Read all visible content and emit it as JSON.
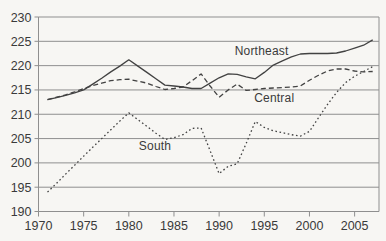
{
  "figure": {
    "background_color": "#f7f6f3",
    "text_color": "#3a3a3a",
    "grid_color": "#8f8f8f",
    "line_color": "#424242"
  },
  "chart_data": {
    "type": "line",
    "title": "",
    "xlabel": "",
    "ylabel": "",
    "xlim": [
      1970,
      2007.7
    ],
    "ylim": [
      190,
      230
    ],
    "grid": "horizontal",
    "legend_position": "inline-annotations",
    "x_ticks": [
      1970,
      1975,
      1980,
      1985,
      1990,
      1995,
      2000,
      2005
    ],
    "y_ticks": [
      230,
      225,
      220,
      215,
      210,
      205,
      200,
      195,
      190
    ],
    "x": [
      1971,
      1972,
      1973,
      1974,
      1975,
      1976,
      1977,
      1978,
      1979,
      1980,
      1981,
      1982,
      1983,
      1984,
      1985,
      1986,
      1987,
      1988,
      1989,
      1990,
      1991,
      1992,
      1993,
      1994,
      1995,
      1996,
      1997,
      1998,
      1999,
      2000,
      2001,
      2002,
      2003,
      2004,
      2005,
      2006,
      2007
    ],
    "series": [
      {
        "name": "Northeast",
        "line_style": "solid",
        "values": [
          213,
          213.4,
          213.9,
          214.4,
          215,
          216.2,
          217.4,
          218.7,
          219.9,
          221.2,
          219.9,
          218.6,
          217.3,
          216,
          215.8,
          215.6,
          215.3,
          215.3,
          216.4,
          217.5,
          218.3,
          218.2,
          217.7,
          217.3,
          218.6,
          220.1,
          221,
          221.8,
          222.4,
          222.5,
          222.5,
          222.5,
          222.6,
          223,
          223.6,
          224.2,
          225.3
        ]
      },
      {
        "name": "Central",
        "line_style": "dashed",
        "values": [
          213,
          213.5,
          214,
          214.6,
          215.3,
          215.9,
          216.4,
          216.9,
          217.1,
          217.2,
          216.8,
          216.4,
          215.7,
          215.1,
          215.3,
          215.6,
          216.9,
          218.3,
          215.8,
          213.5,
          215,
          216.2,
          214.9,
          215.1,
          215.3,
          215.4,
          215.5,
          215.6,
          215.8,
          217,
          218,
          218.9,
          219.3,
          219.3,
          218.9,
          218.7,
          218.8
        ]
      },
      {
        "name": "South",
        "line_style": "dotted",
        "values": [
          194,
          195.8,
          197.7,
          199.5,
          201.4,
          203.2,
          205,
          206.8,
          208.6,
          210.3,
          208.9,
          207.5,
          206.1,
          204.8,
          205.2,
          205.8,
          207.1,
          207.2,
          202.5,
          197.8,
          199.3,
          199.8,
          204,
          208.5,
          207.3,
          206.6,
          206.2,
          205.8,
          205.5,
          206.5,
          209.3,
          212,
          214.5,
          216.5,
          217.8,
          218.8,
          219.8
        ]
      }
    ],
    "annotations": [
      {
        "text": "Northeast",
        "anchor_year": 1994.7,
        "anchor_value": 223.0
      },
      {
        "text": "Central",
        "anchor_year": 1996.1,
        "anchor_value": 213.4
      },
      {
        "text": "South",
        "anchor_year": 1982.9,
        "anchor_value": 203.4
      }
    ]
  }
}
